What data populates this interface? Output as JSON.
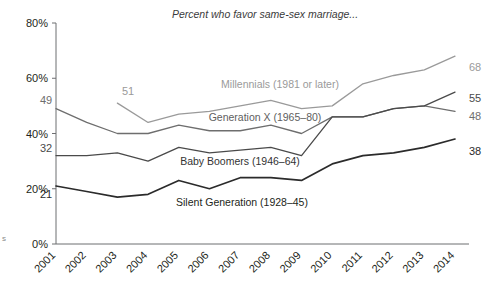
{
  "chart_data": {
    "type": "line",
    "title": "Percent who favor same-sex marriage...",
    "xlabel": "",
    "ylabel": "",
    "ylim": [
      0,
      80
    ],
    "ytick_labels": [
      "0%",
      "20%",
      "40%",
      "60%",
      "80%"
    ],
    "ytick_values": [
      0,
      20,
      40,
      60,
      80
    ],
    "grid": false,
    "legend_position": "inline-labels",
    "x": [
      2001,
      2002,
      2003,
      2004,
      2005,
      2006,
      2007,
      2008,
      2009,
      2010,
      2011,
      2012,
      2013,
      2014
    ],
    "xtick_labels": [
      "2001",
      "2002",
      "2003",
      "2004",
      "2005",
      "2006",
      "2007",
      "2008",
      "2009",
      "2010",
      "2011",
      "2012",
      "2013",
      "2014"
    ],
    "series": [
      {
        "name": "Millennials (1981 or later)",
        "color": "#9a9a9a",
        "start_x": 2003,
        "start_label": "51",
        "end_label": "68",
        "values": [
          null,
          null,
          51,
          44,
          47,
          48,
          50,
          52,
          49,
          50,
          58,
          61,
          63,
          68
        ]
      },
      {
        "name": "Generation X (1965-80)",
        "color": "#6e6e6e",
        "start_x": 2001,
        "start_label": "49",
        "end_label": "48",
        "values": [
          49,
          44,
          40,
          40,
          43,
          41,
          41,
          43,
          40,
          46,
          46,
          49,
          50,
          48
        ]
      },
      {
        "name": "Baby Boomers (1946-64)",
        "color": "#4a4a4a",
        "start_x": 2001,
        "start_label": "32",
        "end_label": "55",
        "values": [
          32,
          32,
          33,
          30,
          35,
          33,
          34,
          35,
          32,
          46,
          46,
          49,
          50,
          55
        ]
      },
      {
        "name": "Silent Generation (1928-45)",
        "color": "#2b2b2b",
        "start_x": 2001,
        "start_label": "21",
        "end_label": "38",
        "values": [
          21,
          19,
          17,
          18,
          23,
          20,
          24,
          24,
          23,
          29,
          32,
          33,
          35,
          38
        ]
      }
    ],
    "inline_labels": [
      {
        "text": "Millennials (1981 or later)",
        "color": "#9a9a9a",
        "x": 280,
        "y": 88
      },
      {
        "text": "Generation X (1965–80)",
        "color": "#5e5e5e",
        "x": 265,
        "y": 121
      },
      {
        "text": "Baby Boomers (1946–64)",
        "color": "#333333",
        "x": 240,
        "y": 165
      },
      {
        "text": "Silent Generation (1928–45)",
        "color": "#231f20",
        "x": 242,
        "y": 206
      }
    ],
    "start_value_labels": [
      {
        "text": "49",
        "color": "#6e6e6e",
        "x": 40,
        "y": 104
      },
      {
        "text": "51",
        "color": "#9a9a9a",
        "x": 122,
        "y": 95
      },
      {
        "text": "32",
        "color": "#4a4a4a",
        "x": 40,
        "y": 152
      },
      {
        "text": "21",
        "color": "#2b2b2b",
        "x": 40,
        "y": 198
      }
    ],
    "end_value_labels": [
      {
        "text": "68",
        "color": "#9a9a9a",
        "x": 469,
        "y": 71
      },
      {
        "text": "55",
        "color": "#4a4a4a",
        "x": 469,
        "y": 102
      },
      {
        "text": "48",
        "color": "#6e6e6e",
        "x": 469,
        "y": 120
      },
      {
        "text": "38",
        "color": "#2b2b2b",
        "x": 469,
        "y": 155
      }
    ],
    "margin_stub": "s"
  }
}
